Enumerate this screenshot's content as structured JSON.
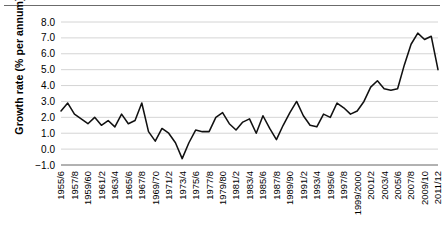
{
  "figure": {
    "has_top_rule": true,
    "background_color": "#ffffff",
    "line_color": "#111111",
    "grid_color": "#c9c9c9",
    "axis_color": "#7a7a7a"
  },
  "chart_data": {
    "type": "line",
    "title": "",
    "subtitle": "",
    "xlabel": "",
    "ylabel": "Growth rate (% per annum)",
    "ylim": [
      -1.0,
      8.0
    ],
    "ytick_step": 1.0,
    "ytick_labels": [
      "8.0",
      "7.0",
      "6.0",
      "5.0",
      "4.0",
      "3.0",
      "2.0",
      "1.0",
      "0.0",
      "−1.0"
    ],
    "ytick_values": [
      8.0,
      7.0,
      6.0,
      5.0,
      4.0,
      3.0,
      2.0,
      1.0,
      0.0,
      -1.0
    ],
    "grid": "horizontal",
    "legend": "none",
    "xtick_labels": [
      "1955/6",
      "1957/8",
      "1959/60",
      "1961/2",
      "1963/4",
      "1965/6",
      "1967/8",
      "1969/70",
      "1971/2",
      "1973/4",
      "1975/6",
      "1977/8",
      "1979/80",
      "1981/2",
      "1983/4",
      "1985/6",
      "1987/8",
      "1989/90",
      "1991/2",
      "1993/4",
      "1995/6",
      "1997/8",
      "1999/2000",
      "2001/2",
      "2003/4",
      "2005/6",
      "2007/8",
      "2009/10",
      "2011/12"
    ],
    "xtick_rotation": 90,
    "xtick_interval_years": 2,
    "categories": [
      "1955/6",
      "1956/7",
      "1957/8",
      "1958/9",
      "1959/60",
      "1960/1",
      "1961/2",
      "1962/3",
      "1963/4",
      "1964/5",
      "1965/6",
      "1966/7",
      "1967/8",
      "1968/9",
      "1969/70",
      "1970/1",
      "1971/2",
      "1972/3",
      "1973/4",
      "1974/5",
      "1975/6",
      "1976/7",
      "1977/8",
      "1978/9",
      "1979/80",
      "1980/1",
      "1981/2",
      "1982/3",
      "1983/4",
      "1984/5",
      "1985/6",
      "1986/7",
      "1987/8",
      "1988/9",
      "1989/90",
      "1990/1",
      "1991/2",
      "1992/3",
      "1993/4",
      "1994/5",
      "1995/6",
      "1996/7",
      "1997/8",
      "1998/9",
      "1999/2000",
      "2000/1",
      "2001/2",
      "2002/3",
      "2003/4",
      "2004/5",
      "2005/6",
      "2006/7",
      "2007/8",
      "2008/9",
      "2009/10",
      "2010/11",
      "2011/12"
    ],
    "values": [
      2.4,
      2.9,
      2.2,
      1.9,
      1.6,
      2.0,
      1.5,
      1.8,
      1.4,
      2.2,
      1.6,
      1.8,
      2.9,
      1.1,
      0.5,
      1.3,
      1.0,
      0.4,
      -0.6,
      0.4,
      1.2,
      1.1,
      1.1,
      2.0,
      2.3,
      1.6,
      1.2,
      1.7,
      1.9,
      1.0,
      2.1,
      1.3,
      0.6,
      1.5,
      2.3,
      3.0,
      2.1,
      1.5,
      1.4,
      2.2,
      2.0,
      2.9,
      2.6,
      2.2,
      2.4,
      3.0,
      3.9,
      4.3,
      3.8,
      3.7,
      3.8,
      5.3,
      6.6,
      7.3,
      6.9,
      7.1,
      5.0
    ],
    "series_name": "Growth rate"
  }
}
